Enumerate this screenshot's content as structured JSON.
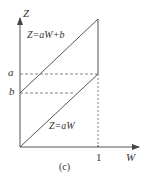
{
  "figure": {
    "caption": "(c)",
    "axes": {
      "y_label": "Z",
      "x_label": "W",
      "x_tick": "1"
    },
    "levels": {
      "a_label": "a",
      "b_label": "b"
    },
    "lines": [
      {
        "name": "upper-line",
        "label": "Z=aW+b",
        "from": [
          0,
          "b"
        ],
        "to": [
          1,
          "a+b"
        ]
      },
      {
        "name": "lower-line",
        "label": "Z=aW",
        "from": [
          0,
          0
        ],
        "to": [
          1,
          "a"
        ]
      }
    ],
    "colors": {
      "stroke": "#555555",
      "text": "#333333"
    }
  }
}
